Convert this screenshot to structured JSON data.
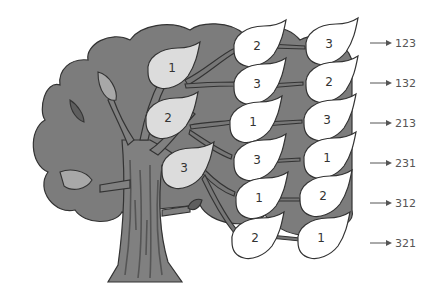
{
  "diagram": {
    "type": "permutation-tree",
    "colors": {
      "canopy": "#7c7c7c",
      "trunk": "#808080",
      "outline": "#333333",
      "first_level_leaf": "#dcdcdc",
      "leaf_white": "#ffffff",
      "dark_leaf": "#5e5e5e",
      "mid_leaf": "#a8a8a8",
      "arrow": "#555555"
    },
    "first_level": [
      {
        "label": "1"
      },
      {
        "label": "2"
      },
      {
        "label": "3"
      }
    ],
    "branches": [
      {
        "second": "2",
        "third": "3",
        "result": "123"
      },
      {
        "second": "3",
        "third": "2",
        "result": "132"
      },
      {
        "second": "1",
        "third": "3",
        "result": "213"
      },
      {
        "second": "3",
        "third": "1",
        "result": "231"
      },
      {
        "second": "1",
        "third": "2",
        "result": "312"
      },
      {
        "second": "2",
        "third": "1",
        "result": "321"
      }
    ]
  }
}
